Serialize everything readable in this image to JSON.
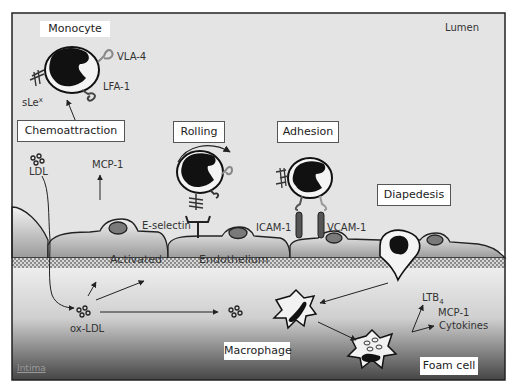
{
  "diagram": {
    "regions": {
      "lumen": "Lumen",
      "intima": "Intima"
    },
    "stages": {
      "monocyte": "Monocyte",
      "chemoattraction": "Chemoattraction",
      "rolling": "Rolling",
      "adhesion": "Adhesion",
      "diapedesis": "Diapedesis",
      "macrophage": "Macrophage",
      "foam_cell": "Foam cell"
    },
    "molecules": {
      "vla4": "VLA-4",
      "lfa1": "LFA-1",
      "slex": "sLe",
      "slex_sup": "x",
      "mcp1_lumen": "MCP-1",
      "ldl": "LDL",
      "e_selectin": "E-selectin",
      "icam1": "ICAM-1",
      "vcam1": "VCAM-1",
      "ox_ldl": "ox-LDL",
      "ltb": "LTB",
      "ltb_sub": "4",
      "mcp1_intima": "MCP-1",
      "cytokines": "Cytokines"
    },
    "endothelium": {
      "activated": "Activated",
      "endothelium": "Endothelium"
    },
    "colors": {
      "lumen_bg": "#e6e6e6",
      "intima_top": "#ececec",
      "intima_bottom": "#4a4a4a",
      "cell_fill": "#f4f4f4",
      "nucleus": "#111111",
      "receptor_grey": "#8a8a8a",
      "frame": "#222222"
    }
  }
}
